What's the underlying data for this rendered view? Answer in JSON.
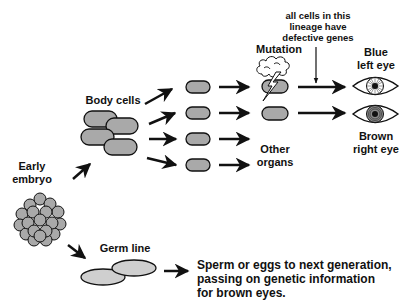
{
  "colors": {
    "cell_fill": "#a9a9a9",
    "germ_fill": "#cfcfcf",
    "stroke": "#111111",
    "background": "#ffffff"
  },
  "labels": {
    "early_embryo": "Early\nembryo",
    "body_cells": "Body cells",
    "mutation": "Mutation",
    "lineage_note": "all cells in this\nlineage have\ndefective genes",
    "blue_left_eye": "Blue\nleft eye",
    "brown_right_eye": "Brown\nright eye",
    "other_organs": "Other\norgans",
    "germ_line": "Germ line",
    "germ_line_outcome": "Sperm or eggs to next generation,\npassing on genetic information\nfor brown eyes."
  },
  "nodes": [
    {
      "id": "early-embryo",
      "label": "Early embryo"
    },
    {
      "id": "body-cells",
      "label": "Body cells"
    },
    {
      "id": "mutated-cell",
      "label": "Mutation"
    },
    {
      "id": "blue-left-eye",
      "label": "Blue left eye"
    },
    {
      "id": "brown-right-eye",
      "label": "Brown right eye"
    },
    {
      "id": "other-organs",
      "label": "Other organs"
    },
    {
      "id": "germ-line",
      "label": "Germ line"
    },
    {
      "id": "next-generation",
      "label": "Sperm or eggs to next generation, passing on genetic information for brown eyes."
    }
  ],
  "edges": [
    {
      "from": "early-embryo",
      "to": "body-cells"
    },
    {
      "from": "early-embryo",
      "to": "germ-line"
    },
    {
      "from": "body-cells",
      "to": "mutated-cell"
    },
    {
      "from": "mutated-cell",
      "to": "blue-left-eye"
    },
    {
      "from": "body-cells",
      "to": "brown-right-eye"
    },
    {
      "from": "body-cells",
      "to": "other-organs"
    },
    {
      "from": "germ-line",
      "to": "next-generation"
    }
  ]
}
